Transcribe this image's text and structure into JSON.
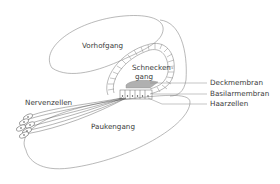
{
  "diagram": {
    "labels": {
      "vorhofgang": "Vorhofgang",
      "schneckengang_line1": "Schnecken-",
      "schneckengang_line2": "gang",
      "deckmembran": "Deckmembran",
      "basilarmembran": "Basilarmembran",
      "haarzellen": "Haarzellen",
      "nervenzellen": "Nervenzellen",
      "paukengang": "Paukengang"
    },
    "colors": {
      "stroke": "#8a8a8a",
      "text": "#3a3a3a",
      "membrane_fill": "#9a9a9a",
      "nerve": "#444444"
    }
  }
}
